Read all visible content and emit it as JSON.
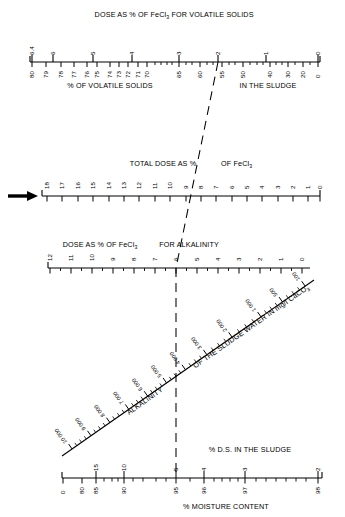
{
  "figure": {
    "kind": "nomogram",
    "caption_top": "DOSE AS % OF FeCl3 FOR VOLATILE SOLIDS",
    "background": "#ffffff",
    "ink": "#000000"
  },
  "chart_data": {
    "type": "line",
    "title": "DOSE AS % OF FeCl3 FOR VOLATILE SOLIDS",
    "subtitle": "Nomogram for ferric chloride dose from volatile solids, alkalinity and moisture content",
    "xlabel": "",
    "ylabel": "",
    "grid": false,
    "legend": "none",
    "axes": [
      {
        "id": "volatile-solids-axis",
        "title_above": "DOSE AS % OF FeCl3 FOR VOLATILE SOLIDS",
        "title_below": "% OF VOLATILE SOLIDS IN THE SLUDGE",
        "orientation": "horizontal",
        "y": 62,
        "x0": 30,
        "x1": 320,
        "labels_above": [
          "6.4",
          "6",
          "5",
          "4",
          "3",
          "2",
          "1",
          "0"
        ],
        "labels_below": [
          "80",
          "79",
          "78",
          "77",
          "76",
          "75",
          "74",
          "73",
          "72",
          "71",
          "70",
          "65",
          "60",
          "55",
          "50",
          "40",
          "30",
          "20",
          "0"
        ],
        "marker_value_below": "55",
        "marker_value_above": "2"
      },
      {
        "id": "total-dose-axis",
        "title_above": "TOTAL DOSE AS % OF FeCl3",
        "orientation": "horizontal",
        "y": 196,
        "x0": 42,
        "x1": 320,
        "labels_above": [
          "18",
          "17",
          "16",
          "15",
          "14",
          "13",
          "12",
          "11",
          "10",
          "9",
          "8",
          "7",
          "6",
          "5",
          "4",
          "3",
          "2",
          "1",
          "0"
        ],
        "marker_value": "8",
        "arrow": "left-arrow-pointing-right"
      },
      {
        "id": "alkalinity-dose-axis",
        "title_above": "DOSE AS % OF FeCl3 FOR ALKALINITY",
        "orientation": "horizontal",
        "y": 268,
        "x0": 48,
        "x1": 310,
        "labels_above": [
          "12",
          "11",
          "10",
          "9",
          "8",
          "7",
          "6",
          "5",
          "4",
          "3",
          "2",
          "1",
          "0"
        ],
        "marker_value": "6"
      },
      {
        "id": "alkalinity-diagonal-axis",
        "title": "ALKALINITY OF THE SLUDGE WATER IN mg/l CaCO3",
        "orientation": "diagonal",
        "labels": [
          "10 000",
          "9 000",
          "8 000",
          "7 000",
          "6 000",
          "5 000",
          "4 000",
          "3 000",
          "2 000",
          "1 000",
          "500",
          "100"
        ],
        "from": [
          62,
          456
        ],
        "to": [
          312,
          282
        ]
      },
      {
        "id": "moisture-content-axis",
        "title_above_right": "% D.S. IN THE SLUDGE",
        "title_below": "% MOISTURE CONTENT",
        "orientation": "horizontal",
        "y": 478,
        "x0": 62,
        "x1": 320,
        "labels_above": [
          "15",
          "10",
          "5",
          "4",
          "3",
          "2"
        ],
        "labels_below": [
          "0",
          "80",
          "85",
          "90",
          "95",
          "96",
          "97",
          "98"
        ],
        "marker_value_below": "95",
        "marker_value_above": "5"
      }
    ],
    "construction_line": {
      "style": "dashed",
      "description": "Dashed worked-example line linking 55% volatile solids to total dose 18%",
      "points": [
        [
          218,
          62
        ],
        [
          176,
          268
        ],
        [
          176,
          478
        ]
      ]
    }
  },
  "labels": {
    "top_title": "DOSE AS % OF FeCl",
    "top_title_sub": "3",
    "top_title_tail": " FOR VOLATILE SOLIDS",
    "volatile_below_left": "% OF VOLATILE SOLIDS",
    "volatile_below_right": "IN THE SLUDGE",
    "total_dose_left": "TOTAL DOSE AS %",
    "total_dose_right": "OF FeCl",
    "total_dose_sub": "3",
    "alk_dose_left": "DOSE AS % OF FeCl",
    "alk_dose_sub": "3",
    "alk_dose_right": " FOR ALKALINITY",
    "diag_word_1": "ALKALINITY",
    "diag_word_2": "OF THE SLUDGE WATER IN mg/l CaCO",
    "diag_word_sub": "3",
    "ds_in_sludge": "% D.S. IN THE SLUDGE",
    "moisture_content": "% MOISTURE CONTENT"
  },
  "ticks": {
    "vs_above": [
      {
        "v": "6.4",
        "x": 32
      },
      {
        "v": "6",
        "x": 53
      },
      {
        "v": "5",
        "x": 93
      },
      {
        "v": "4",
        "x": 132
      },
      {
        "v": "3",
        "x": 179
      },
      {
        "v": "2",
        "x": 218
      },
      {
        "v": "1",
        "x": 266
      },
      {
        "v": "0",
        "x": 318
      }
    ],
    "vs_below": [
      {
        "v": "80",
        "x": 32
      },
      {
        "v": "79",
        "x": 46
      },
      {
        "v": "78",
        "x": 61
      },
      {
        "v": "77",
        "x": 74
      },
      {
        "v": "76",
        "x": 87
      },
      {
        "v": "75",
        "x": 97
      },
      {
        "v": "74",
        "x": 110
      },
      {
        "v": "73",
        "x": 119
      },
      {
        "v": "72",
        "x": 128
      },
      {
        "v": "71",
        "x": 138
      },
      {
        "v": "70",
        "x": 147
      },
      {
        "v": "65",
        "x": 179
      },
      {
        "v": "60",
        "x": 200
      },
      {
        "v": "55",
        "x": 222
      },
      {
        "v": "50",
        "x": 243
      },
      {
        "v": "40",
        "x": 270
      },
      {
        "v": "30",
        "x": 288
      },
      {
        "v": "20",
        "x": 303
      },
      {
        "v": "0",
        "x": 318
      }
    ],
    "total_dose": [
      {
        "v": "18",
        "x": 47
      },
      {
        "v": "17",
        "x": 62
      },
      {
        "v": "16",
        "x": 78
      },
      {
        "v": "15",
        "x": 93
      },
      {
        "v": "14",
        "x": 109
      },
      {
        "v": "13",
        "x": 124
      },
      {
        "v": "12",
        "x": 139
      },
      {
        "v": "11",
        "x": 155
      },
      {
        "v": "10",
        "x": 170
      },
      {
        "v": "9",
        "x": 186
      },
      {
        "v": "8",
        "x": 201
      },
      {
        "v": "7",
        "x": 216
      },
      {
        "v": "6",
        "x": 232
      },
      {
        "v": "5",
        "x": 247
      },
      {
        "v": "4",
        "x": 262
      },
      {
        "v": "3",
        "x": 278
      },
      {
        "v": "2",
        "x": 293
      },
      {
        "v": "1",
        "x": 308
      },
      {
        "v": "0",
        "x": 320
      }
    ],
    "alk_dose": [
      {
        "v": "12",
        "x": 50
      },
      {
        "v": "11",
        "x": 71
      },
      {
        "v": "10",
        "x": 92
      },
      {
        "v": "9",
        "x": 113
      },
      {
        "v": "8",
        "x": 134
      },
      {
        "v": "7",
        "x": 155
      },
      {
        "v": "6",
        "x": 176
      },
      {
        "v": "5",
        "x": 197
      },
      {
        "v": "4",
        "x": 218
      },
      {
        "v": "3",
        "x": 239
      },
      {
        "v": "2",
        "x": 260
      },
      {
        "v": "1",
        "x": 281
      },
      {
        "v": "0",
        "x": 302
      }
    ],
    "diagonal": [
      {
        "v": "10 000",
        "t": 0.04
      },
      {
        "v": "9 000",
        "t": 0.115
      },
      {
        "v": "8 000",
        "t": 0.19
      },
      {
        "v": "7 000",
        "t": 0.265
      },
      {
        "v": "6 000",
        "t": 0.34
      },
      {
        "v": "5 000",
        "t": 0.415
      },
      {
        "v": "4 000",
        "t": 0.49
      },
      {
        "v": "3 000",
        "t": 0.575
      },
      {
        "v": "2 000",
        "t": 0.675
      },
      {
        "v": "1 000",
        "t": 0.79
      },
      {
        "v": "500",
        "t": 0.875
      },
      {
        "v": "100",
        "t": 0.965
      }
    ],
    "moisture_above": [
      {
        "v": "15",
        "x": 96
      },
      {
        "v": "10",
        "x": 124
      },
      {
        "v": "5",
        "x": 176
      },
      {
        "v": "4",
        "x": 204
      },
      {
        "v": "3",
        "x": 245
      },
      {
        "v": "2",
        "x": 318
      }
    ],
    "moisture_below": [
      {
        "v": "0",
        "x": 63
      },
      {
        "v": "80",
        "x": 82
      },
      {
        "v": "85",
        "x": 96
      },
      {
        "v": "90",
        "x": 124
      },
      {
        "v": "95",
        "x": 176
      },
      {
        "v": "96",
        "x": 204
      },
      {
        "v": "97",
        "x": 245
      },
      {
        "v": "98",
        "x": 318
      }
    ]
  }
}
